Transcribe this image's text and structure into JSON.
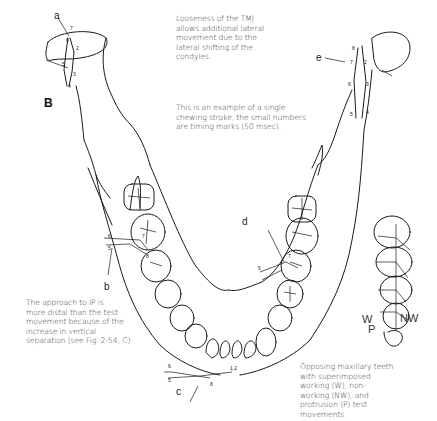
{
  "figure": {
    "panel_label": "B",
    "captions": {
      "tmj_looseness": "Looseness of the TMJ\nallows additional lateral\nmovement due to the\nlateral shifting of the\ncondyles.",
      "chewing_stroke": "This is an example of a single\nchewing stroke, the small numbers\nare timing marks (50 msec).",
      "approach_ip": "The approach to IP is\nmore distal than the test\nmovement because of the\nincrease in vertical\nseparation (see Fig. 2-54, C).",
      "opposing_teeth": "Opposing maxillary teeth\nwith superimposed\nworking (W), non-\nworking (NW), and\nprotrusion (P) test\nmovements."
    },
    "point_labels": {
      "a": "a",
      "b": "b",
      "c": "c",
      "d": "d",
      "e": "e"
    },
    "movement_labels": {
      "working": "W",
      "non_working": "NW",
      "protrusion": "P"
    },
    "timing_marks": [
      "1",
      "2",
      "3",
      "4",
      "5",
      "6",
      "7",
      "8"
    ]
  }
}
